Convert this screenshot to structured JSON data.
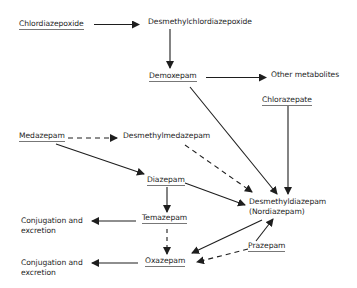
{
  "diagram": {
    "type": "metabolic-pathway",
    "nodes": {
      "chlordiazepoxide": {
        "label": "Chlordiazepoxide",
        "underlined": true
      },
      "desmethylchlordiazepoxide": {
        "label": "Desmethylchlordiazepoxide",
        "underlined": false
      },
      "demoxepam": {
        "label": "Demoxepam",
        "underlined": true
      },
      "other_metabolites": {
        "label": "Other metabolites",
        "underlined": false
      },
      "chlorazepate": {
        "label": "Chlorazepate",
        "underlined": true
      },
      "medazepam": {
        "label": "Medazepam",
        "underlined": true
      },
      "desmethylmedazepam": {
        "label": "Desmethylmedazepam",
        "underlined": false
      },
      "diazepam": {
        "label": "Diazepam",
        "underlined": true
      },
      "desmethyldiazepam_line1": {
        "label": "Desmethyldiazepam",
        "underlined": false
      },
      "desmethyldiazepam_line2": {
        "label": "(Nordiazepam)",
        "underlined": false
      },
      "temazepam": {
        "label": "Temazepam",
        "underlined": true
      },
      "oxazepam": {
        "label": "Oxazepam",
        "underlined": true
      },
      "prazepam": {
        "label": "Prazepam",
        "underlined": true
      },
      "conjugation1_line1": {
        "label": "Conjugation and",
        "underlined": false
      },
      "conjugation1_line2": {
        "label": "excretion",
        "underlined": false
      },
      "conjugation2_line1": {
        "label": "Conjugation and",
        "underlined": false
      },
      "conjugation2_line2": {
        "label": "excretion",
        "underlined": false
      }
    },
    "edges": [
      {
        "from": "Chlordiazepoxide",
        "to": "Desmethylchlordiazepoxide",
        "style": "solid"
      },
      {
        "from": "Desmethylchlordiazepoxide",
        "to": "Demoxepam",
        "style": "solid"
      },
      {
        "from": "Demoxepam",
        "to": "Other metabolites",
        "style": "solid"
      },
      {
        "from": "Demoxepam",
        "to": "Desmethyldiazepam",
        "style": "solid"
      },
      {
        "from": "Chlorazepate",
        "to": "Desmethyldiazepam",
        "style": "solid"
      },
      {
        "from": "Medazepam",
        "to": "Desmethylmedazepam",
        "style": "dashed"
      },
      {
        "from": "Medazepam",
        "to": "Diazepam",
        "style": "solid"
      },
      {
        "from": "Desmethylmedazepam",
        "to": "Desmethyldiazepam",
        "style": "dashed"
      },
      {
        "from": "Diazepam",
        "to": "Desmethyldiazepam",
        "style": "solid"
      },
      {
        "from": "Diazepam",
        "to": "Temazepam",
        "style": "solid"
      },
      {
        "from": "Temazepam",
        "to": "Conjugation and excretion",
        "style": "solid"
      },
      {
        "from": "Temazepam",
        "to": "Oxazepam",
        "style": "dashed"
      },
      {
        "from": "Desmethyldiazepam",
        "to": "Oxazepam",
        "style": "solid"
      },
      {
        "from": "Prazepam",
        "to": "Desmethyldiazepam",
        "style": "solid"
      },
      {
        "from": "Prazepam",
        "to": "Oxazepam",
        "style": "dashed"
      },
      {
        "from": "Oxazepam",
        "to": "Conjugation and excretion",
        "style": "solid"
      }
    ],
    "colors": {
      "line": "#1e1e1e",
      "background": "#ffffff"
    }
  }
}
